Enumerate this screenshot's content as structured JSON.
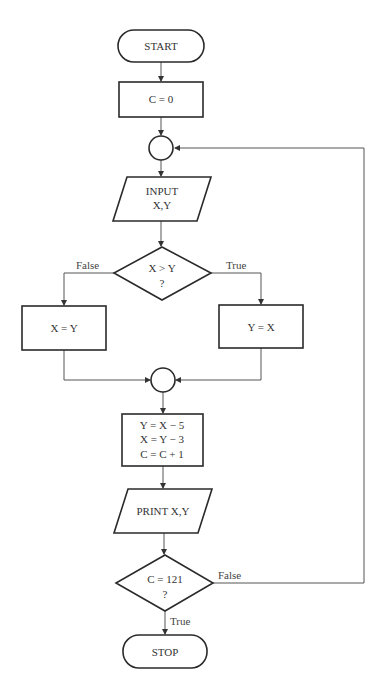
{
  "flowchart": {
    "start": {
      "label": "START"
    },
    "init": {
      "label": "C = 0"
    },
    "input": {
      "line1": "INPUT",
      "line2": "X,Y"
    },
    "decision1": {
      "line1": "X > Y",
      "line2": "?",
      "false_label": "False",
      "true_label": "True"
    },
    "assign_false": {
      "label": "X = Y"
    },
    "assign_true": {
      "label": "Y = X"
    },
    "compute": {
      "line1": "Y = X − 5",
      "line2": "X = Y − 3",
      "line3": "C = C + 1"
    },
    "print": {
      "label": "PRINT X,Y"
    },
    "decision2": {
      "line1": "C = 121",
      "line2": "?",
      "false_label": "False",
      "true_label": "True"
    },
    "stop": {
      "label": "STOP"
    }
  }
}
